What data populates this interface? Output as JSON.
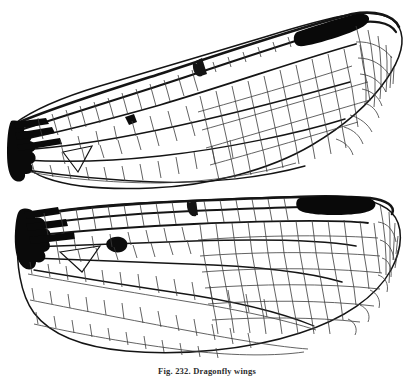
{
  "figure": {
    "kind": "scientific-line-illustration",
    "subject": "dragonfly wings",
    "caption": "Fig. 232. Dragonfly wings",
    "background_color": "#ffffff",
    "ink_color": "#101010",
    "vein_color": "#3a3a3a",
    "membrane_color": "#ffffff",
    "panels": [
      {
        "name": "forewing",
        "label": "upper wing",
        "orientation": "base at lower-left, apex at upper-right",
        "features": [
          {
            "name": "pterostigma",
            "color": "#080808",
            "position": "subapical on costal margin"
          },
          {
            "name": "wing-base",
            "color": "#080808",
            "position": "extreme left, thickened"
          },
          {
            "name": "nodus",
            "position": "mid costal margin"
          },
          {
            "name": "arculus-spot",
            "color": "#080808",
            "position": "basal third"
          },
          {
            "name": "triangle",
            "position": "basal"
          },
          {
            "name": "cell-network",
            "description": "dense polygonal venation"
          }
        ]
      },
      {
        "name": "hindwing",
        "label": "lower wing",
        "orientation": "base at left, apex at right, broad anal field",
        "features": [
          {
            "name": "pterostigma",
            "color": "#080808",
            "position": "subapical on costal margin"
          },
          {
            "name": "wing-base",
            "color": "#080808",
            "position": "extreme left, thickened"
          },
          {
            "name": "nodus",
            "position": "mid costal margin"
          },
          {
            "name": "arculus-spot",
            "color": "#080808",
            "position": "basal third"
          },
          {
            "name": "anal-loop",
            "position": "basal posterior"
          },
          {
            "name": "cell-network",
            "description": "dense polygonal venation"
          }
        ]
      }
    ]
  }
}
